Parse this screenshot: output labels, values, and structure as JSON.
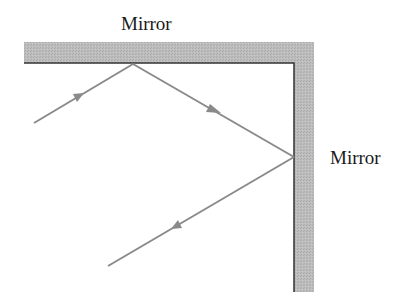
{
  "labels": {
    "top_mirror": "Mirror",
    "right_mirror": "Mirror"
  },
  "colors": {
    "mirror_fill": "#b8b8b8",
    "mirror_edge": "#333333",
    "ray": "#8a8a8a",
    "text": "#1a1a1a"
  }
}
